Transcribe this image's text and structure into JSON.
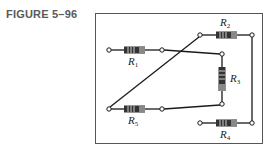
{
  "figure": {
    "label": "FIGURE 5–96"
  },
  "colors": {
    "wire": "#1a1a1a",
    "frame": "#555555",
    "resistor_body": "#333333",
    "resistor_band": "#d0d0d0",
    "resistor_end": "#888888"
  },
  "resistors": [
    {
      "id": "R1",
      "name": "R",
      "sub": "1"
    },
    {
      "id": "R2",
      "name": "R",
      "sub": "2"
    },
    {
      "id": "R3",
      "name": "R",
      "sub": "3"
    },
    {
      "id": "R4",
      "name": "R",
      "sub": "4"
    },
    {
      "id": "R5",
      "name": "R",
      "sub": "5"
    }
  ]
}
